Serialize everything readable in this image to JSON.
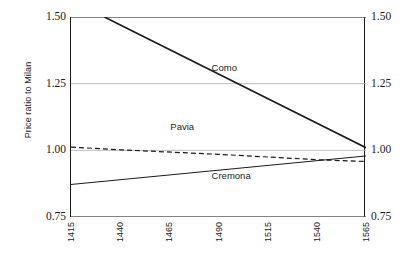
{
  "chart_data": {
    "type": "line",
    "title": "",
    "xlabel": "",
    "ylabel": "Price ratio to Milan",
    "xlim": [
      1415,
      1565
    ],
    "ylim": [
      0.75,
      1.5
    ],
    "xticks": [
      "1415",
      "1440",
      "1465",
      "1490",
      "1515",
      "1540",
      "1565"
    ],
    "xtick_values": [
      1415,
      1440,
      1465,
      1490,
      1515,
      1540,
      1565
    ],
    "yticks": [
      "0.75",
      "1.00",
      "1.25",
      "1.50"
    ],
    "ytick_values": [
      0.75,
      1.0,
      1.25,
      1.5
    ],
    "grid": "horizontal gridlines at 0.75, 1.00, 1.25, 1.50",
    "legend": "inline series labels inside plot area",
    "series": [
      {
        "name": "Como",
        "style": "solid",
        "width": 1.6,
        "color": "#1a1a1a",
        "x": [
          1432,
          1565
        ],
        "y": [
          1.5,
          1.01
        ],
        "label_x": 1487,
        "label_y": 1.31
      },
      {
        "name": "Pavia",
        "style": "dashed",
        "width": 1.2,
        "color": "#1a1a1a",
        "x": [
          1415,
          1440,
          1490,
          1540,
          1565
        ],
        "y": [
          1.012,
          1.002,
          0.985,
          0.965,
          0.958
        ],
        "label_x": 1466,
        "label_y": 1.086
      },
      {
        "name": "Cremona",
        "style": "solid",
        "width": 1.0,
        "color": "#1a1a1a",
        "x": [
          1415,
          1565
        ],
        "y": [
          0.872,
          0.979
        ],
        "label_x": 1487,
        "label_y": 0.905
      }
    ]
  },
  "axes": {
    "left_ticks": [
      "1.50",
      "1.25",
      "1.00",
      "0.75"
    ],
    "right_ticks": [
      "1.50",
      "1.25",
      "1.00",
      "0.75"
    ],
    "y_axis_title": "Price ratio to Milan",
    "x_ticks": [
      "1415",
      "1440",
      "1465",
      "1490",
      "1515",
      "1540",
      "1565"
    ]
  },
  "colors": {
    "line": "#1a1a1a",
    "grid": "#b5b5b5",
    "frame": "#1a1a1a",
    "background": "#ffffff",
    "text": "#1a1a1a"
  }
}
